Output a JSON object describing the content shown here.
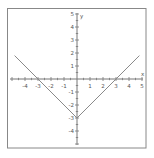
{
  "chart_data": {
    "type": "line",
    "title": "",
    "function": "y = |x| - 3",
    "xlabel": "x",
    "ylabel": "y",
    "xlim": [
      -4.8,
      4.9
    ],
    "ylim": [
      -5,
      5
    ],
    "x_ticks": [
      -4,
      -3,
      -2,
      -1,
      1,
      2,
      3,
      4,
      5
    ],
    "y_ticks": [
      5,
      4,
      3,
      2,
      1,
      -1,
      -2,
      -3,
      -4
    ],
    "grid": false,
    "series": [
      {
        "name": "y=|x|-3",
        "x": [
          -4.8,
          -3,
          0,
          3,
          4.8
        ],
        "y": [
          1.8,
          0,
          -3,
          0,
          1.8
        ]
      }
    ],
    "colors": {
      "line": "#8a8a8a",
      "axis": "#777777",
      "frame": "#888888"
    }
  },
  "labels": {
    "x_axis": "x",
    "y_axis": "y",
    "x_ticks": [
      "-4",
      "-3",
      "-2",
      "-1",
      "1",
      "2",
      "3",
      "4",
      "5"
    ],
    "y_ticks": [
      "5",
      "4",
      "3",
      "2",
      "1",
      "-1",
      "-2",
      "-3",
      "-4"
    ]
  }
}
